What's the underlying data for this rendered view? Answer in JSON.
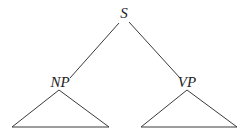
{
  "diagram": {
    "type": "syntax-tree",
    "nodes": {
      "root": {
        "label": "S"
      },
      "left": {
        "label": "NP"
      },
      "right": {
        "label": "VP"
      }
    },
    "edges": [
      {
        "from": "S",
        "to": "NP"
      },
      {
        "from": "S",
        "to": "VP"
      }
    ],
    "subtrees": [
      {
        "under": "NP",
        "shape": "triangle"
      },
      {
        "under": "VP",
        "shape": "triangle"
      }
    ],
    "colors": {
      "line": "#3a3a3a",
      "text": "#222222",
      "background": "#ffffff"
    }
  }
}
